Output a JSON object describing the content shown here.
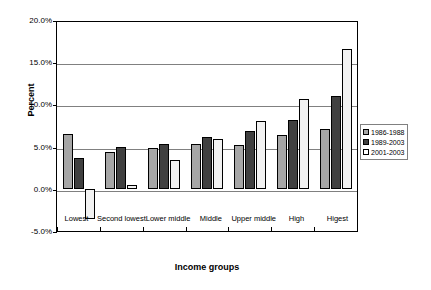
{
  "chart_data": {
    "type": "bar",
    "title": "",
    "xlabel": "Income groups",
    "ylabel": "Percent",
    "ylim": [
      -5.0,
      20.0
    ],
    "ytick_labels": [
      "20.0%",
      "15.0%",
      "10.0%",
      "5.0%",
      "0.0%",
      "-5.0%"
    ],
    "ytick_values": [
      20.0,
      15.0,
      10.0,
      5.0,
      0.0,
      -5.0
    ],
    "grid": true,
    "legend_position": "right",
    "categories": [
      "Lowest",
      "Second lowest",
      "Lower middle",
      "Middle",
      "Upper middle",
      "High",
      "Higest"
    ],
    "series": [
      {
        "name": "1986-1988",
        "color": "#a6a6a6",
        "values": [
          6.5,
          4.4,
          4.8,
          5.35,
          5.2,
          6.35,
          7.05
        ]
      },
      {
        "name": "1989-2003",
        "color": "#404040",
        "values": [
          3.7,
          4.9,
          5.35,
          6.1,
          6.9,
          8.2,
          10.95
        ]
      },
      {
        "name": "2001-2003",
        "color": "#f2f2f2",
        "values": [
          -3.6,
          0.4,
          3.4,
          5.9,
          8.0,
          10.65,
          16.6
        ]
      }
    ]
  }
}
